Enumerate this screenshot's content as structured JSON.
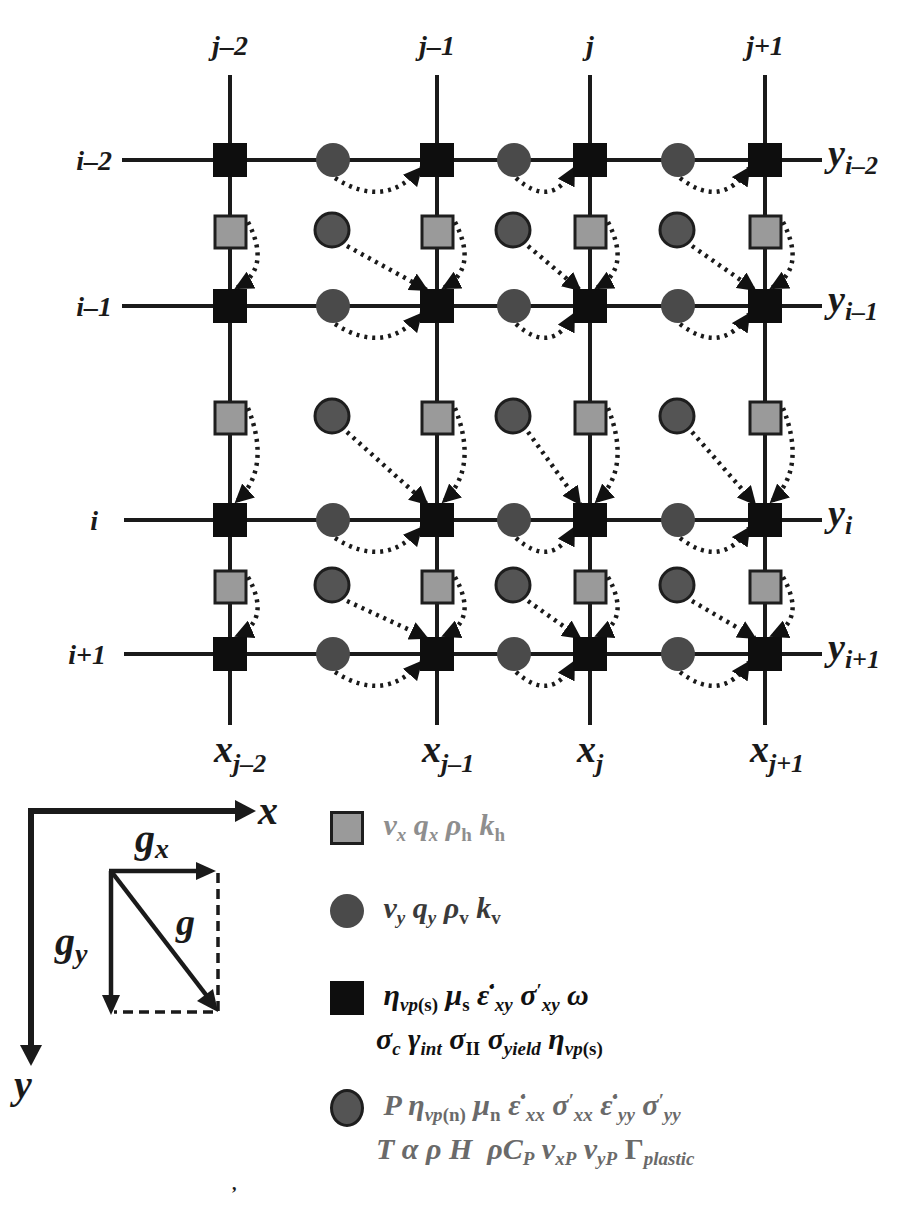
{
  "grid": {
    "column_labels": [
      "j–2",
      "j–1",
      "j",
      "j+1"
    ],
    "row_labels": [
      "i–2",
      "i–1",
      "i",
      "i+1"
    ],
    "x_axis_labels": [
      {
        "base": "x",
        "sub": "j–2"
      },
      {
        "base": "x",
        "sub": "j–1"
      },
      {
        "base": "x",
        "sub": "j"
      },
      {
        "base": "x",
        "sub": "j+1"
      }
    ],
    "y_axis_labels": [
      {
        "base": "y",
        "sub": "i–2"
      },
      {
        "base": "y",
        "sub": "i–1"
      },
      {
        "base": "y",
        "sub": "i"
      },
      {
        "base": "y",
        "sub": "i+1"
      }
    ],
    "column_x": [
      230,
      437,
      590,
      765
    ],
    "row_y": [
      160,
      306,
      520,
      654
    ],
    "vx_square_y": [
      232,
      418,
      587
    ],
    "vy_circle_x": [
      333,
      514,
      678
    ],
    "colors": {
      "basic_node": "#0e0e0e",
      "vx_node": "#9a9a9a",
      "vy_node": "#4a4a4a",
      "line": "#1a1a1a"
    }
  },
  "gravity_diagram": {
    "x_axis_label": "x",
    "y_axis_label": "y",
    "gx_label": {
      "base": "g",
      "sub": "x"
    },
    "gy_label": {
      "base": "g",
      "sub": "y"
    },
    "g_vector_label": "g⃗"
  },
  "legend": {
    "items": [
      {
        "marker": "gray-square",
        "color": "#8e8e8e",
        "lines": [
          [
            {
              "b": "v",
              "s": "x"
            },
            {
              "b": "q",
              "s": "x"
            },
            {
              "b": "ρ",
              "s": "h",
              "sr": true
            },
            {
              "b": "k",
              "s": "h",
              "sr": true
            }
          ]
        ],
        "text": "v_x q_x ρ_h k_h"
      },
      {
        "marker": "dark-circle",
        "color": "#3a3a3a",
        "text": "v_y q_y ρ_v k_v"
      },
      {
        "marker": "black-square",
        "color": "#111111",
        "text_line1": "η_vp(s) μ_s ε̇′_xy σ′_xy ω",
        "text_line2": "σ_c γ_int σ_II σ_yield η_vp(s)"
      },
      {
        "marker": "gray-circle",
        "color": "#6a6a6a",
        "text_line1": "P η_vp(n) μ_n ε̇′_xx σ′_xx ε̇′_yy σ′_yy",
        "text_line2": "T α ρ H ρC_P v_xP v_yP Γ_plastic"
      }
    ],
    "symbols": {
      "v": "v",
      "q": "q",
      "rho": "ρ",
      "k": "k",
      "eta": "η",
      "mu": "μ",
      "epsdot": "ε̇",
      "prime": "′",
      "sigma": "σ",
      "omega": "ω",
      "gamma": "γ",
      "alpha": "α",
      "Gamma": "Γ",
      "P": "P",
      "T": "T",
      "H": "H",
      "C": "C",
      "sub_x": "x",
      "sub_y": "y",
      "sub_h": "h",
      "sub_v": "v",
      "sub_vps": "vp",
      "sub_s_paren": "(s)",
      "sub_n_paren": "(n)",
      "sub_s": "s",
      "sub_n": "n",
      "sub_xy": "xy",
      "sub_xx": "xx",
      "sub_yy": "yy",
      "sub_c": "c",
      "sub_int": "int",
      "sub_II": "II",
      "sub_yield": "yield",
      "sub_P": "P",
      "sub_xP": "xP",
      "sub_yP": "yP",
      "sub_plastic": "plastic"
    }
  },
  "footer_mark": ","
}
